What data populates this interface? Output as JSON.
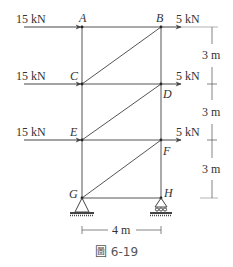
{
  "diagram": {
    "type": "truss",
    "caption": "圖 6-19",
    "nodes": [
      {
        "id": "A",
        "x": 82,
        "y": 27
      },
      {
        "id": "B",
        "x": 161,
        "y": 27
      },
      {
        "id": "C",
        "x": 82,
        "y": 84
      },
      {
        "id": "D",
        "x": 161,
        "y": 84
      },
      {
        "id": "E",
        "x": 82,
        "y": 140
      },
      {
        "id": "F",
        "x": 161,
        "y": 140
      },
      {
        "id": "G",
        "x": 82,
        "y": 198
      },
      {
        "id": "H",
        "x": 161,
        "y": 198
      }
    ],
    "members": [
      [
        "A",
        "B"
      ],
      [
        "C",
        "D"
      ],
      [
        "E",
        "F"
      ],
      [
        "G",
        "H"
      ],
      [
        "A",
        "C"
      ],
      [
        "C",
        "E"
      ],
      [
        "E",
        "G"
      ],
      [
        "B",
        "D"
      ],
      [
        "D",
        "F"
      ],
      [
        "F",
        "H"
      ],
      [
        "C",
        "B"
      ],
      [
        "E",
        "D"
      ],
      [
        "G",
        "F"
      ]
    ],
    "loads": [
      {
        "node": "A",
        "label": "15 kN",
        "side": "left"
      },
      {
        "node": "C",
        "label": "15 kN",
        "side": "left"
      },
      {
        "node": "E",
        "label": "15 kN",
        "side": "left"
      },
      {
        "node": "B",
        "label": "5 kN",
        "side": "right"
      },
      {
        "node": "D",
        "label": "5 kN",
        "side": "right"
      },
      {
        "node": "F",
        "label": "5 kN",
        "side": "right"
      }
    ],
    "supports": [
      {
        "node": "G",
        "type": "pin"
      },
      {
        "node": "H",
        "type": "roller"
      }
    ],
    "dimensions": {
      "vertical": [
        "3 m",
        "3 m",
        "3 m"
      ],
      "horizontal": "4 m"
    }
  },
  "labels": {
    "A": "A",
    "B": "B",
    "C": "C",
    "D": "D",
    "E": "E",
    "F": "F",
    "G": "G",
    "H": "H",
    "load_left_1": "15 kN",
    "load_left_2": "15 kN",
    "load_left_3": "15 kN",
    "load_right_1": "5 kN",
    "load_right_2": "5 kN",
    "load_right_3": "5 kN",
    "dim_v1": "3 m",
    "dim_v2": "3 m",
    "dim_v3": "3 m",
    "dim_h": "4 m",
    "caption": "圖 6-19"
  }
}
